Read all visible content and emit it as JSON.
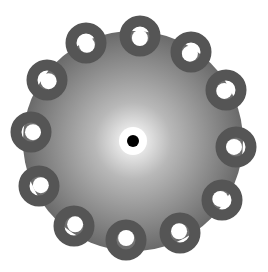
{
  "image": {
    "description": "grey radial-gradient disc with twelve dark grey rings around its edge and a black center dot",
    "colors": {
      "background": "#ffffff",
      "disc_center": "#ffffff",
      "disc_edge": "#6a6a6a",
      "ring": "#555555",
      "center_dot": "#000000"
    },
    "disc": {
      "cx": 133,
      "cy": 141,
      "r": 110
    },
    "rings": [
      {
        "cx": 140,
        "cy": 36
      },
      {
        "cx": 191,
        "cy": 52
      },
      {
        "cx": 226,
        "cy": 90
      },
      {
        "cx": 236,
        "cy": 147
      },
      {
        "cx": 222,
        "cy": 200
      },
      {
        "cx": 180,
        "cy": 233
      },
      {
        "cx": 126,
        "cy": 240
      },
      {
        "cx": 74,
        "cy": 226
      },
      {
        "cx": 39,
        "cy": 186
      },
      {
        "cx": 31,
        "cy": 132
      },
      {
        "cx": 47,
        "cy": 80
      },
      {
        "cx": 86,
        "cy": 43
      }
    ]
  }
}
